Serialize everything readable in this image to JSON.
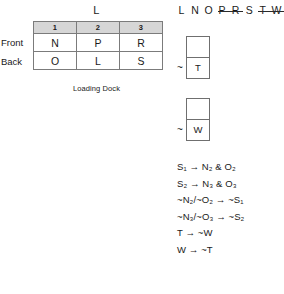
{
  "shelf": {
    "top_label": "L",
    "column_headers": [
      "1",
      "2",
      "3"
    ],
    "row_labels": [
      "Front",
      "Back"
    ],
    "rows": [
      {
        "label": "Front",
        "cells": [
          "N",
          "P",
          "R"
        ]
      },
      {
        "label": "Back",
        "cells": [
          "O",
          "L",
          "S"
        ]
      }
    ],
    "caption": "Loading Dock"
  },
  "letter_strip": {
    "letters": [
      {
        "text": "L",
        "struck": false
      },
      {
        "text": "N",
        "struck": false
      },
      {
        "text": "O",
        "struck": false
      },
      {
        "text": "P",
        "struck": true
      },
      {
        "text": "R",
        "struck": true
      },
      {
        "text": "S",
        "struck": false
      },
      {
        "text": "T",
        "struck": true
      },
      {
        "text": "W",
        "struck": true
      }
    ]
  },
  "slot_groups": [
    {
      "negation": "~",
      "top_cell": "",
      "bottom_cell": "T"
    },
    {
      "negation": "~",
      "top_cell": "",
      "bottom_cell": "W"
    }
  ],
  "logic": {
    "lines": [
      "S₁ → N₂ & O₂",
      "S₂ → N₃ & O₃",
      "~N₂/~O₂ → ~S₁",
      "~N₃/~O₃ → ~S₂",
      "T → ~W",
      "W → ~T"
    ]
  },
  "colors": {
    "header_fill": "#d6d6d6",
    "border": "#7b7b7b",
    "text": "#1a1a1a",
    "background": "#ffffff"
  }
}
